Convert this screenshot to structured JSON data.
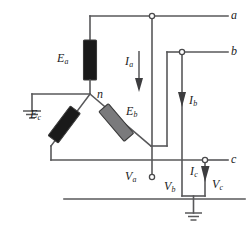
{
  "diagram": {
    "type": "electrical-schematic",
    "colors": {
      "wire": "#58585a",
      "element_dark": "#1a1a1a",
      "element_gray": "#7a7a7c",
      "label_text": "#1c1c1c",
      "background": "#ffffff"
    },
    "sources": [
      {
        "id": "Ea",
        "letter": "E",
        "subscript": "a",
        "fill": "dark",
        "orientation": "vertical"
      },
      {
        "id": "Eb",
        "letter": "E",
        "subscript": "b",
        "fill": "gray",
        "orientation": "diagonal-right"
      },
      {
        "id": "Ec",
        "letter": "E",
        "subscript": "c",
        "fill": "dark",
        "orientation": "diagonal-left"
      }
    ],
    "neutral": {
      "id": "n",
      "label": "n"
    },
    "terminals": [
      {
        "id": "a",
        "label": "a"
      },
      {
        "id": "b",
        "label": "b"
      },
      {
        "id": "c",
        "label": "c"
      }
    ],
    "currents": [
      {
        "id": "Ia",
        "letter": "I",
        "subscript": "a",
        "direction": "down"
      },
      {
        "id": "Ib",
        "letter": "I",
        "subscript": "b",
        "direction": "down"
      },
      {
        "id": "Ic",
        "letter": "I",
        "subscript": "c",
        "direction": "down"
      }
    ],
    "voltages": [
      {
        "id": "Va",
        "letter": "V",
        "subscript": "a"
      },
      {
        "id": "Vb",
        "letter": "V",
        "subscript": "b"
      },
      {
        "id": "Vc",
        "letter": "V",
        "subscript": "c"
      }
    ],
    "grounds": [
      {
        "id": "ground-neutral",
        "position": "left"
      },
      {
        "id": "ground-reference",
        "position": "bottom"
      }
    ]
  }
}
